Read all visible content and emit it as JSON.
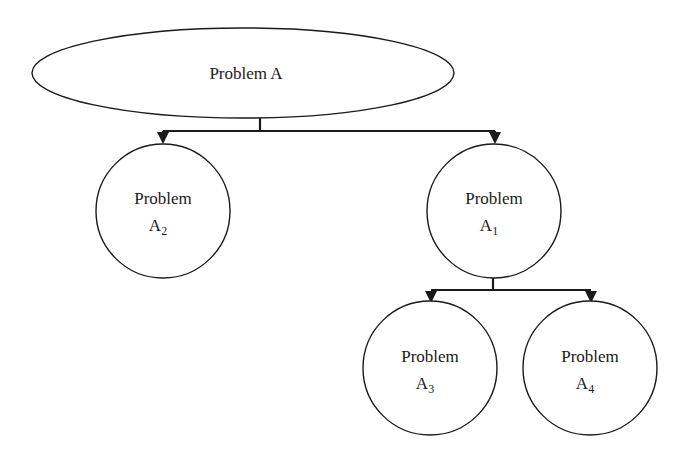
{
  "diagram": {
    "type": "problem-decomposition-tree",
    "colors": {
      "stroke": "#1a1a1a",
      "fill": "#ffffff",
      "text": "#1a1a1a"
    },
    "nodes": {
      "root": {
        "shape": "ellipse",
        "label": "Problem A"
      },
      "a2": {
        "shape": "circle",
        "label_line1": "Problem",
        "label_main": "A",
        "label_sub": "2"
      },
      "a1": {
        "shape": "circle",
        "label_line1": "Problem",
        "label_main": "A",
        "label_sub": "1"
      },
      "a3": {
        "shape": "circle",
        "label_line1": "Problem",
        "label_main": "A",
        "label_sub": "3"
      },
      "a4": {
        "shape": "circle",
        "label_line1": "Problem",
        "label_main": "A",
        "label_sub": "4"
      }
    },
    "edges": [
      {
        "from": "Problem A",
        "to": "Problem A2"
      },
      {
        "from": "Problem A",
        "to": "Problem A1"
      },
      {
        "from": "Problem A1",
        "to": "Problem A3"
      },
      {
        "from": "Problem A1",
        "to": "Problem A4"
      }
    ]
  }
}
